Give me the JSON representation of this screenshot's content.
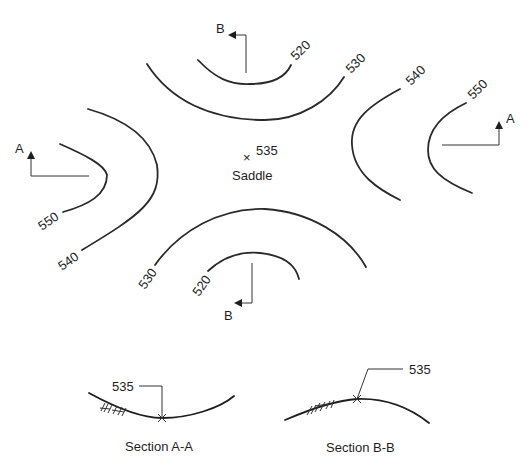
{
  "diagram": {
    "contours": {
      "top_inner": "520",
      "top_outer": "530",
      "right_inner": "550",
      "right_outer": "540",
      "left_inner": "550",
      "left_outer": "540",
      "bottom_outer": "530",
      "bottom_inner": "520"
    },
    "saddle": {
      "elevation": "535",
      "label": "Saddle",
      "marker": "×"
    },
    "section_markers": {
      "a_left": "A",
      "a_right": "A",
      "b_top": "B",
      "b_bottom": "B"
    },
    "sections": [
      {
        "elevation": "535",
        "caption": "Section A-A"
      },
      {
        "elevation": "535",
        "caption": "Section B-B"
      }
    ],
    "colors": {
      "line": "#2a2a2a",
      "background": "#ffffff"
    }
  }
}
